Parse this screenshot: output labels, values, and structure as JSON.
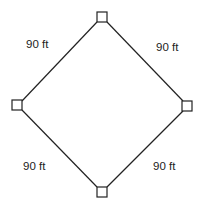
{
  "diagram": {
    "type": "baseball-diamond",
    "bases": [
      {
        "name": "second-base",
        "cx": 102,
        "cy": 17
      },
      {
        "name": "third-base",
        "cx": 17,
        "cy": 105
      },
      {
        "name": "first-base",
        "cx": 187,
        "cy": 106
      },
      {
        "name": "home-plate",
        "cx": 102,
        "cy": 192
      }
    ],
    "labels": {
      "top_left": "90 ft",
      "top_right": "90 ft",
      "bottom_left": "90 ft",
      "bottom_right": "90 ft"
    },
    "colors": {
      "line": "#222222",
      "background": "#ffffff"
    }
  }
}
